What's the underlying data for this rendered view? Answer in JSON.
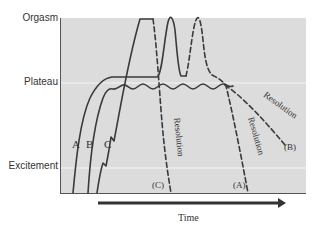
{
  "diagram": {
    "y_axis_levels": [
      {
        "label": "Orgasm"
      },
      {
        "label": "Plateau"
      },
      {
        "label": "Excitement"
      }
    ],
    "x_axis": {
      "label": "Time"
    },
    "curves": [
      {
        "id": "A",
        "label": "A",
        "end_label": "(A)"
      },
      {
        "id": "B",
        "label": "B",
        "end_label": "(B)"
      },
      {
        "id": "C",
        "label": "C",
        "end_label": "(C)"
      }
    ],
    "phase_annotations": [
      {
        "label": "Resolution",
        "curve": "C"
      },
      {
        "label": "Resolution",
        "curve": "A"
      },
      {
        "label": "Resolution",
        "curve": "B"
      }
    ],
    "colors": {
      "plot_background": "#dcdcdc",
      "line": "#3a3a3a",
      "guide": "#f4f4f4"
    }
  }
}
